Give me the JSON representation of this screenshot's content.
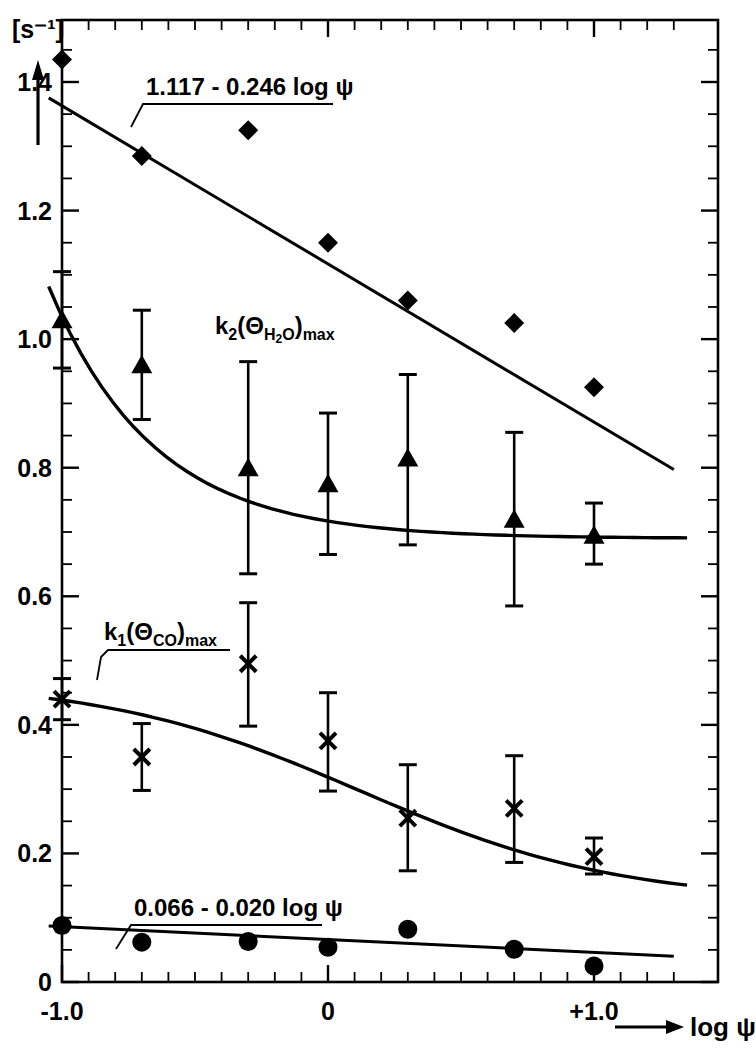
{
  "figure": {
    "unit_label": "[s⁻¹]",
    "y_axis_arrow": "y-axis-arrow",
    "x_axis_title": "log ψ",
    "x_axis_arrow": "x-axis-arrow"
  },
  "axes": {
    "x_ticks": [
      {
        "value": -1.0,
        "label": "-1.0"
      },
      {
        "value": 0.0,
        "label": "0"
      },
      {
        "value": 1.0,
        "label": "+1.0"
      }
    ],
    "y_ticks": [
      {
        "value": 0.0,
        "label": "0"
      },
      {
        "value": 0.2,
        "label": "0.2"
      },
      {
        "value": 0.4,
        "label": "0.4"
      },
      {
        "value": 0.6,
        "label": "0.6"
      },
      {
        "value": 0.8,
        "label": "0.8"
      },
      {
        "value": 1.0,
        "label": "1.0"
      },
      {
        "value": 1.2,
        "label": "1.2"
      },
      {
        "value": 1.4,
        "label": "1.4"
      }
    ]
  },
  "annotations": [
    {
      "id": "fit-top",
      "text": "1.117 - 0.246 log ψ"
    },
    {
      "id": "series-k2",
      "text": "k₂(θ_H2O)ₘₐₓ"
    },
    {
      "id": "series-k1",
      "text": "k₁(θ_CO)ₘₐₓ"
    },
    {
      "id": "fit-bottom",
      "text": "0.066 - 0.020 log ψ"
    }
  ],
  "chart_data": {
    "type": "scatter",
    "title": "",
    "xlabel": "log ψ",
    "ylabel": "[s⁻¹]",
    "xlim": [
      -1.15,
      1.35
    ],
    "ylim": [
      0,
      1.47
    ],
    "grid": false,
    "legend": "none",
    "frame": "box",
    "minor_ticks": true,
    "series": [
      {
        "name": "diamonds",
        "marker": "diamond",
        "color": "#000000",
        "x": [
          -1.0,
          -0.7,
          -0.3,
          0.0,
          0.3,
          0.7,
          1.0
        ],
        "y": [
          1.435,
          1.285,
          1.325,
          1.15,
          1.06,
          1.025,
          0.925
        ],
        "errors": null,
        "fit_label": "1.117 - 0.246 log ψ",
        "fit_type": "linear",
        "fit_intercept": 1.117,
        "fit_slope": -0.246,
        "fit_x": [
          -1.05,
          1.3
        ]
      },
      {
        "name": "k2(θH2O)max",
        "marker": "triangle",
        "color": "#000000",
        "x": [
          -1.0,
          -0.7,
          -0.3,
          0.0,
          0.3,
          0.7,
          1.0
        ],
        "y": [
          1.03,
          0.96,
          0.8,
          0.775,
          0.815,
          0.72,
          0.695
        ],
        "errors": [
          {
            "low": 0.955,
            "high": 1.105
          },
          {
            "low": 0.875,
            "high": 1.045
          },
          {
            "low": 0.635,
            "high": 0.965
          },
          {
            "low": 0.665,
            "high": 0.885
          },
          {
            "low": 0.68,
            "high": 0.945
          },
          {
            "low": 0.585,
            "high": 0.855
          },
          {
            "low": 0.65,
            "high": 0.745
          }
        ],
        "label": "k₂(θ_H2O)ₘₐₓ",
        "fit_type": "curve"
      },
      {
        "name": "k1(θCO)max",
        "marker": "cross",
        "color": "#000000",
        "x": [
          -1.0,
          -0.7,
          -0.3,
          0.0,
          0.3,
          0.7,
          1.0
        ],
        "y": [
          0.44,
          0.35,
          0.495,
          0.375,
          0.255,
          0.27,
          0.195
        ],
        "errors": [
          {
            "low": 0.408,
            "high": 0.472
          },
          {
            "low": 0.298,
            "high": 0.402
          },
          {
            "low": 0.398,
            "high": 0.59
          },
          {
            "low": 0.297,
            "high": 0.45
          },
          {
            "low": 0.173,
            "high": 0.338
          },
          {
            "low": 0.186,
            "high": 0.352
          },
          {
            "low": 0.168,
            "high": 0.224
          }
        ],
        "label": "k₁(θ_CO)ₘₐₓ",
        "fit_type": "curve"
      },
      {
        "name": "circles",
        "marker": "circle",
        "color": "#000000",
        "x": [
          -1.0,
          -0.7,
          -0.3,
          0.0,
          0.3,
          0.7,
          1.0
        ],
        "y": [
          0.088,
          0.062,
          0.063,
          0.054,
          0.082,
          0.051,
          0.025
        ],
        "errors": null,
        "fit_label": "0.066 - 0.020 log ψ",
        "fit_type": "linear",
        "fit_intercept": 0.066,
        "fit_slope": -0.02,
        "fit_x": [
          -1.05,
          1.3
        ]
      }
    ]
  }
}
